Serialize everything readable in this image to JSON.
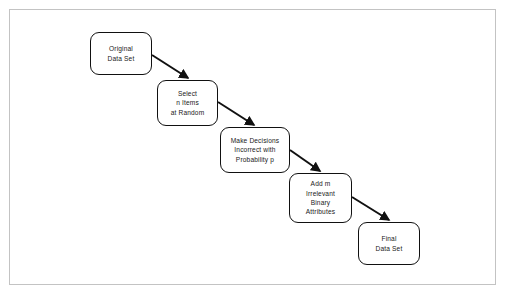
{
  "diagram": {
    "type": "flowchart",
    "orientation": "diagonal-cascade-down-right",
    "background_color": "#ffffff",
    "frame": {
      "border_color": "#c3c3c3",
      "visible": true
    },
    "node_style": {
      "shape": "rounded-rectangle",
      "border_color": "#111111",
      "fill_color": "#ffffff",
      "text_color": "#1a1a1a",
      "corner_radius": 9
    },
    "edge_style": {
      "color": "#111111",
      "arrowhead": "filled-triangle",
      "width": 2
    },
    "nodes": [
      {
        "id": "original-data-set",
        "label": "Original\nData Set",
        "lines": [
          "Original",
          "Data Set"
        ],
        "x": 90,
        "y": 32,
        "width": 62,
        "height": 43
      },
      {
        "id": "select-n-items",
        "label": "Select\nn Items\nat Random",
        "lines": [
          "Select",
          "n Items",
          "at Random"
        ],
        "x": 157,
        "y": 80,
        "width": 61,
        "height": 46
      },
      {
        "id": "make-decisions-incorrect",
        "label": "Make Decisions\nIncorrect with\nProbability p",
        "lines": [
          "Make Decisions",
          "Incorrect with",
          "Probability p"
        ],
        "x": 220,
        "y": 127,
        "width": 70,
        "height": 46
      },
      {
        "id": "add-irrelevant-attributes",
        "label": "Add m\nIrrelevant\nBinary\nAttributes",
        "lines": [
          "Add m",
          "Irrelevant",
          "Binary",
          "Attributes"
        ],
        "x": 289,
        "y": 173,
        "width": 63,
        "height": 50
      },
      {
        "id": "final-data-set",
        "label": "Final\nData Set",
        "lines": [
          "Final",
          "Data Set"
        ],
        "x": 358,
        "y": 222,
        "width": 62,
        "height": 43
      }
    ],
    "edges": [
      {
        "id": "edge-1",
        "from": "original-data-set",
        "to": "select-n-items",
        "x1": 152,
        "y1": 55,
        "x2": 188,
        "y2": 78
      },
      {
        "id": "edge-2",
        "from": "select-n-items",
        "to": "make-decisions-incorrect",
        "x1": 218,
        "y1": 102,
        "x2": 254,
        "y2": 125
      },
      {
        "id": "edge-3",
        "from": "make-decisions-incorrect",
        "to": "add-irrelevant-attributes",
        "x1": 290,
        "y1": 150,
        "x2": 320,
        "y2": 171
      },
      {
        "id": "edge-4",
        "from": "add-irrelevant-attributes",
        "to": "final-data-set",
        "x1": 352,
        "y1": 197,
        "x2": 389,
        "y2": 220
      }
    ]
  }
}
